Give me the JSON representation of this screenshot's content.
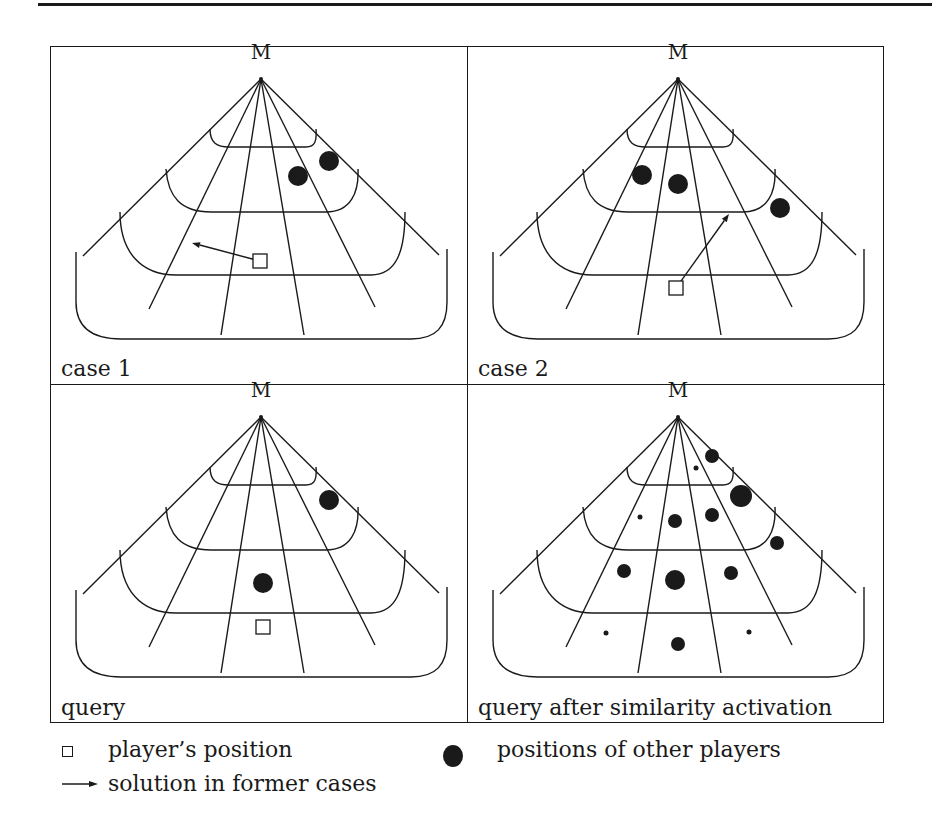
{
  "figure": {
    "apex_label": "M",
    "panels": [
      {
        "id": "case1",
        "label": "case 1",
        "squares": [
          {
            "x": 209,
            "y": 214
          }
        ],
        "arrows": [
          {
            "x1": 209,
            "y1": 214,
            "x2": 141,
            "y2": 196
          }
        ],
        "dots": [
          {
            "x": 247,
            "y": 129,
            "r": 10
          },
          {
            "x": 278,
            "y": 114,
            "r": 10
          }
        ]
      },
      {
        "id": "case2",
        "label": "case 2",
        "squares": [
          {
            "x": 208,
            "y": 241
          }
        ],
        "arrows": [
          {
            "x1": 208,
            "y1": 241,
            "x2": 261,
            "y2": 167
          }
        ],
        "dots": [
          {
            "x": 174,
            "y": 128,
            "r": 10
          },
          {
            "x": 210,
            "y": 137,
            "r": 10
          },
          {
            "x": 312,
            "y": 161,
            "r": 10
          }
        ]
      },
      {
        "id": "query",
        "label": "query",
        "squares": [
          {
            "x": 212,
            "y": 242
          }
        ],
        "arrows": [],
        "dots": [
          {
            "x": 278,
            "y": 115,
            "r": 10
          },
          {
            "x": 212,
            "y": 198,
            "r": 10
          }
        ]
      },
      {
        "id": "query_after",
        "label": "query after similarity activation",
        "squares": [],
        "arrows": [],
        "dots": [
          {
            "x": 244,
            "y": 71,
            "r": 7
          },
          {
            "x": 228,
            "y": 83,
            "r": 2.5
          },
          {
            "x": 273,
            "y": 111,
            "r": 11
          },
          {
            "x": 244,
            "y": 130,
            "r": 7
          },
          {
            "x": 207,
            "y": 136,
            "r": 7
          },
          {
            "x": 172,
            "y": 132,
            "r": 2.5
          },
          {
            "x": 309,
            "y": 158,
            "r": 7
          },
          {
            "x": 156,
            "y": 186,
            "r": 7
          },
          {
            "x": 207,
            "y": 195,
            "r": 10
          },
          {
            "x": 263,
            "y": 188,
            "r": 7
          },
          {
            "x": 138,
            "y": 248,
            "r": 2.5
          },
          {
            "x": 281,
            "y": 247,
            "r": 2.5
          },
          {
            "x": 210,
            "y": 259,
            "r": 7
          }
        ]
      }
    ]
  },
  "legend": {
    "player_position": "player’s position",
    "solution": "solution in former cases",
    "other_players": "positions of other players"
  },
  "colors": {
    "ink": "#1a1a1a",
    "background": "#ffffff"
  }
}
